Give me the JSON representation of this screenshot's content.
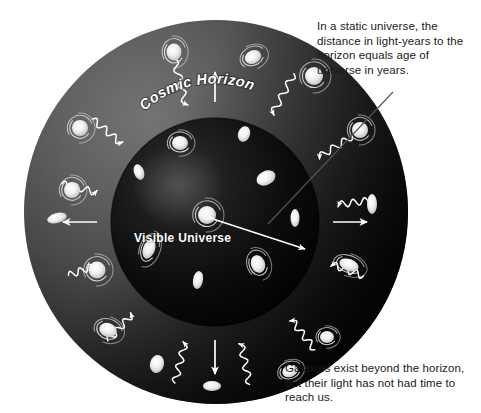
{
  "diagram": {
    "background_color": "#ffffff",
    "labels": {
      "cosmic_horizon": "Cosmic Horizon",
      "visible_universe": "Visible Universe"
    },
    "captions": {
      "static_universe": "In a static universe, the distance in light-years to the horizon equals age of universe in years.",
      "galaxies_beyond": "Galaxies exist beyond the horizon, but their light has not had time to reach us."
    },
    "colors": {
      "page_background": "#ffffff",
      "outer_sphere_light": "#6e6e6e",
      "outer_sphere_mid": "#4a4a4a",
      "outer_sphere_dark": "#141414",
      "inner_sphere_light": "#2a2a2a",
      "inner_sphere_dark": "#000000",
      "galaxy_color": "#f2f2f2",
      "arrow_color": "#ffffff",
      "leader_line_color": "#555555",
      "caption_text": "#1a1a1a",
      "in_label_text": "#ffffff"
    },
    "geometry": {
      "outer_sphere": {
        "cx": 216,
        "cy": 212,
        "r": 192
      },
      "inner_sphere": {
        "cx": 215,
        "cy": 222,
        "r": 104
      },
      "center_galaxy": {
        "cx": 207,
        "cy": 215
      }
    },
    "leader_line": {
      "from_x": 393,
      "from_y": 92,
      "to_x": 268,
      "to_y": 224
    },
    "measure_arrow": {
      "from_x": 213,
      "from_y": 219,
      "to_x": 305,
      "to_y": 249
    },
    "outer_galaxies": [
      {
        "cx": 174,
        "cy": 52,
        "rx": 7.5,
        "ry": 8.5,
        "rot": 0,
        "type": "spiral"
      },
      {
        "cx": 253,
        "cy": 57,
        "rx": 8.5,
        "ry": 6.5,
        "rot": -25,
        "type": "spiral"
      },
      {
        "cx": 80,
        "cy": 128,
        "rx": 8,
        "ry": 8,
        "rot": 0,
        "type": "spiral"
      },
      {
        "cx": 314,
        "cy": 76,
        "rx": 9,
        "ry": 9,
        "rot": 0,
        "type": "spiral"
      },
      {
        "cx": 360,
        "cy": 130,
        "rx": 8,
        "ry": 8,
        "rot": 0,
        "type": "spiral"
      },
      {
        "cx": 72,
        "cy": 190,
        "rx": 8,
        "ry": 8,
        "rot": 0,
        "type": "spiral"
      },
      {
        "cx": 57,
        "cy": 218,
        "rx": 10,
        "ry": 5,
        "rot": -15,
        "type": "elliptical"
      },
      {
        "cx": 372,
        "cy": 204,
        "rx": 5,
        "ry": 10,
        "rot": 0,
        "type": "elliptical"
      },
      {
        "cx": 97,
        "cy": 270,
        "rx": 8.5,
        "ry": 8.5,
        "rot": 0,
        "type": "spiral"
      },
      {
        "cx": 349,
        "cy": 265,
        "rx": 10,
        "ry": 6,
        "rot": 20,
        "type": "spiral"
      },
      {
        "cx": 108,
        "cy": 330,
        "rx": 9,
        "ry": 7,
        "rot": 20,
        "type": "spiral"
      },
      {
        "cx": 157,
        "cy": 364,
        "rx": 7,
        "ry": 9,
        "rot": 15,
        "type": "elliptical"
      },
      {
        "cx": 212,
        "cy": 386,
        "rx": 9,
        "ry": 5,
        "rot": 0,
        "type": "elliptical"
      },
      {
        "cx": 290,
        "cy": 371,
        "rx": 8,
        "ry": 6,
        "rot": -20,
        "type": "spiral"
      },
      {
        "cx": 327,
        "cy": 337,
        "rx": 7,
        "ry": 6,
        "rot": 0,
        "type": "spiral"
      }
    ],
    "inner_galaxies": [
      {
        "cx": 207,
        "cy": 215,
        "rx": 9,
        "ry": 9,
        "rot": 0,
        "type": "spiral"
      },
      {
        "cx": 180,
        "cy": 143,
        "rx": 8,
        "ry": 7,
        "rot": 0,
        "type": "spiral"
      },
      {
        "cx": 244,
        "cy": 134,
        "rx": 6,
        "ry": 8,
        "rot": 20,
        "type": "elliptical"
      },
      {
        "cx": 139,
        "cy": 172,
        "rx": 5,
        "ry": 8,
        "rot": -20,
        "type": "elliptical"
      },
      {
        "cx": 266,
        "cy": 178,
        "rx": 10,
        "ry": 7,
        "rot": -25,
        "type": "elliptical"
      },
      {
        "cx": 149,
        "cy": 249,
        "rx": 6,
        "ry": 10,
        "rot": 20,
        "type": "spiral"
      },
      {
        "cx": 258,
        "cy": 264,
        "rx": 7,
        "ry": 9,
        "rot": -20,
        "type": "spiral"
      },
      {
        "cx": 198,
        "cy": 280,
        "rx": 5,
        "ry": 9,
        "rot": 10,
        "type": "elliptical"
      },
      {
        "cx": 295,
        "cy": 218,
        "rx": 4.5,
        "ry": 9,
        "rot": 0,
        "type": "elliptical"
      }
    ],
    "radial_arrows": [
      {
        "angle": -90,
        "start_r": 120,
        "len": 30
      },
      {
        "angle": 0,
        "start_r": 118,
        "len": 34
      },
      {
        "angle": 90,
        "start_r": 118,
        "len": 34
      },
      {
        "angle": 180,
        "start_r": 118,
        "len": 34
      }
    ],
    "light_rays": [
      {
        "angle": -104,
        "outer_r": 168,
        "inner_r": 120
      },
      {
        "angle": -62,
        "outer_r": 168,
        "inner_r": 122
      },
      {
        "angle": -140,
        "outer_r": 160,
        "inner_r": 122
      },
      {
        "angle": -32,
        "outer_r": 162,
        "inner_r": 122
      },
      {
        "angle": -166,
        "outer_r": 158,
        "inner_r": 122
      },
      {
        "angle": -8,
        "outer_r": 160,
        "inner_r": 124
      },
      {
        "angle": 20,
        "outer_r": 158,
        "inner_r": 124
      },
      {
        "angle": 52,
        "outer_r": 162,
        "inner_r": 124
      },
      {
        "angle": 78,
        "outer_r": 166,
        "inner_r": 124
      },
      {
        "angle": 104,
        "outer_r": 166,
        "inner_r": 124
      },
      {
        "angle": 132,
        "outer_r": 160,
        "inner_r": 124
      },
      {
        "angle": 160,
        "outer_r": 156,
        "inner_r": 124
      }
    ]
  }
}
